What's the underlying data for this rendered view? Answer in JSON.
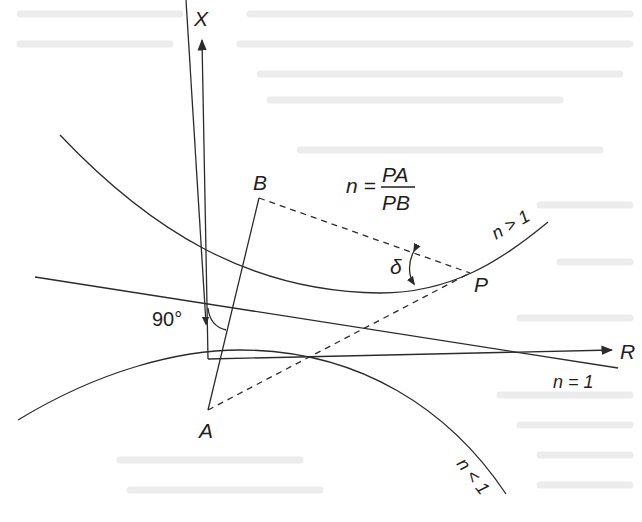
{
  "figure": {
    "axes": {
      "vertical_label": "X",
      "horizontal_label": "R"
    },
    "points": {
      "A": "A",
      "B": "B",
      "P": "P"
    },
    "ratio_formula": {
      "lhs": "n =",
      "numerator": "PA",
      "denominator": "PB"
    },
    "angle_labels": {
      "right_angle": "90°",
      "delta": "δ"
    },
    "curve_labels": {
      "n_greater_1": "n > 1",
      "n_equal_1": "n = 1",
      "n_less_1": "n < 1"
    },
    "colors": {
      "ink": "#2b2b2b",
      "background": "#ffffff",
      "bleed_through": "#ececec"
    }
  }
}
